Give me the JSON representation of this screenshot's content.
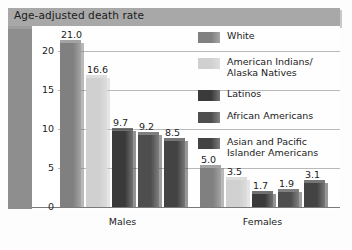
{
  "title": "Age-adjusted death rate",
  "legend": {
    "items": [
      {
        "label": "White",
        "color": "#808080"
      },
      {
        "label": "American Indians/\nAlaska Natives",
        "color": "#d0d0d0"
      },
      {
        "label": "Latinos",
        "color": "#3a3a3a"
      },
      {
        "label": "African Americans",
        "color": "#4e4e4e"
      },
      {
        "label": "Asian and Pacific\nIslander Americans",
        "color": "#434343"
      }
    ]
  },
  "axis": {
    "yticks": [
      "0",
      "5",
      "10",
      "15",
      "20"
    ],
    "group_labels": [
      "Males",
      "Females"
    ]
  },
  "chart_data": {
    "type": "bar",
    "title": "Age-adjusted death rate",
    "xlabel": "",
    "ylabel": "",
    "ylim": [
      0,
      22
    ],
    "yticks": [
      0,
      5,
      10,
      15,
      20
    ],
    "grid": true,
    "legend_position": "right",
    "categories": [
      "Males",
      "Females"
    ],
    "series": [
      {
        "name": "White",
        "color": "#808080",
        "values": [
          21.0,
          5.0
        ]
      },
      {
        "name": "American Indians/Alaska Natives",
        "color": "#d0d0d0",
        "values": [
          16.6,
          3.5
        ]
      },
      {
        "name": "Latinos",
        "color": "#3a3a3a",
        "values": [
          9.7,
          1.7
        ]
      },
      {
        "name": "African Americans",
        "color": "#4e4e4e",
        "values": [
          9.2,
          1.9
        ]
      },
      {
        "name": "Asian and Pacific Islander Americans",
        "color": "#434343",
        "values": [
          8.5,
          3.1
        ]
      }
    ],
    "data_labels": {
      "Males": [
        "21.0",
        "16.6",
        "9.7",
        "9.2",
        "8.5"
      ],
      "Females": [
        "5.0",
        "3.5",
        "1.7",
        "1.9",
        "3.1"
      ]
    }
  }
}
